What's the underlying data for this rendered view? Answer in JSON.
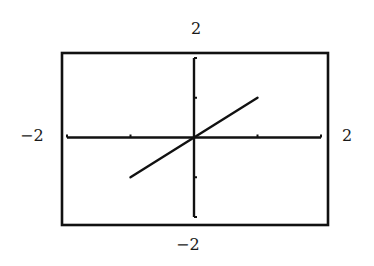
{
  "chart_data": {
    "type": "line",
    "title": "",
    "xlabel": "",
    "ylabel": "",
    "xlim": [
      -2,
      2
    ],
    "ylim": [
      -2,
      2
    ],
    "grid": false,
    "legend": null,
    "window_labels": {
      "ymax": "2",
      "ymin": "-2",
      "xmin": "-2",
      "xmax": "2"
    },
    "x_ticks": [
      -2,
      -1,
      0,
      1,
      2
    ],
    "y_ticks": [
      -2,
      -1,
      0,
      1,
      2
    ],
    "series": [
      {
        "name": "y = x",
        "x": [
          -1,
          1
        ],
        "y": [
          -1,
          1
        ]
      }
    ]
  },
  "labels": {
    "top": "2",
    "bottom": "−2",
    "left": "−2",
    "right": "2"
  },
  "colors": {
    "ink": "#111111",
    "background": "#ffffff"
  }
}
